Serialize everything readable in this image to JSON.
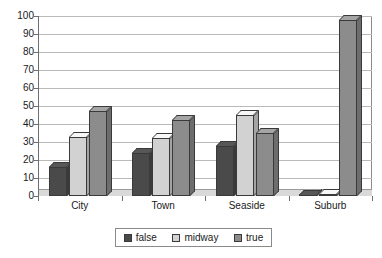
{
  "chart_data": {
    "type": "bar",
    "title": "",
    "subtitle": "",
    "xlabel": "",
    "ylabel": "",
    "categories": [
      "City",
      "Town",
      "Seaside",
      "Suburb"
    ],
    "series": [
      {
        "name": "false",
        "color": "#4a4a4a",
        "values": [
          16,
          24,
          28,
          0
        ]
      },
      {
        "name": "midway",
        "color": "#d2d2d2",
        "values": [
          33,
          32,
          45,
          1
        ]
      },
      {
        "name": "true",
        "color": "#8c8c8c",
        "values": [
          47,
          42,
          35,
          98
        ]
      }
    ],
    "ylim": [
      0,
      100
    ],
    "yticks": [
      0,
      10,
      20,
      30,
      40,
      50,
      60,
      70,
      80,
      90,
      100
    ],
    "ytick_labels": [
      "0",
      "10",
      "20",
      "30",
      "40",
      "50",
      "60",
      "70",
      "80",
      "90",
      "100"
    ],
    "grid": true,
    "grid_axis": "y",
    "legend_position": "bottom",
    "style": "3d-column"
  },
  "legend": {
    "items": [
      {
        "label": "false",
        "swatch": "legend-swatch-false"
      },
      {
        "label": "midway",
        "swatch": "legend-swatch-midway"
      },
      {
        "label": "true",
        "swatch": "legend-swatch-true"
      }
    ]
  },
  "colors": {
    "false": "#4a4a4a",
    "midway": "#d2d2d2",
    "true": "#8c8c8c",
    "gridline": "#b9b9b9",
    "axis": "#6e6e6e",
    "frame": "#8a8a8a",
    "bar_outline": "#3a3a3a",
    "floor": "#d9d9d9",
    "background": "#ffffff",
    "text": "#1a1a1a"
  }
}
